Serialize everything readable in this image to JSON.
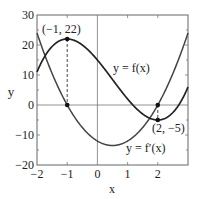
{
  "chart_data": {
    "type": "line",
    "title": "",
    "xlabel": "x",
    "ylabel": "y",
    "xlim": [
      -2,
      3
    ],
    "ylim": [
      -20,
      30
    ],
    "grid": false,
    "x_ticks": [
      "-2",
      "-1",
      "0",
      "1",
      "2"
    ],
    "y_ticks": [
      "-20",
      "-10",
      "0",
      "10",
      "20",
      "30"
    ],
    "series": [
      {
        "name": "y = f(x)",
        "formula": "2x^3 - 3x^2 - 12x + 15",
        "x": [
          -2,
          -1.5,
          -1,
          -0.5,
          0,
          0.5,
          1,
          1.5,
          2,
          2.5,
          3
        ],
        "values": [
          11,
          19.5,
          22,
          19.5,
          15,
          8.5,
          2,
          -3.5,
          -5,
          -2.5,
          6
        ]
      },
      {
        "name": "y = f'(x)",
        "formula": "6x^2 - 6x - 12",
        "x": [
          -2,
          -1.5,
          -1,
          -0.5,
          0,
          0.5,
          1,
          1.5,
          2,
          2.5,
          3
        ],
        "values": [
          24,
          10.5,
          0,
          -7.5,
          -12,
          -13.5,
          -12,
          -7.5,
          0,
          10.5,
          24
        ]
      }
    ],
    "annotations": [
      {
        "text": "(−1, 22)",
        "x": -1,
        "y": 22
      },
      {
        "text": "(2, −5)",
        "x": 2,
        "y": -5
      },
      {
        "text": "y = f(x)",
        "label_for": "f"
      },
      {
        "text": "y = f′(x)",
        "label_for": "fprime"
      }
    ]
  },
  "labels": {
    "xlabel": "x",
    "ylabel": "y",
    "max_point": "(−1, 22)",
    "min_point": "(2, −5)",
    "f_label": "y = f(x)",
    "fprime_label": "y = f′(x)",
    "xt0": "−2",
    "xt1": "−1",
    "xt2": "0",
    "xt3": "1",
    "xt4": "2",
    "yt0": "−20",
    "yt1": "−10",
    "yt2": "0",
    "yt3": "10",
    "yt4": "20",
    "yt5": "30"
  }
}
